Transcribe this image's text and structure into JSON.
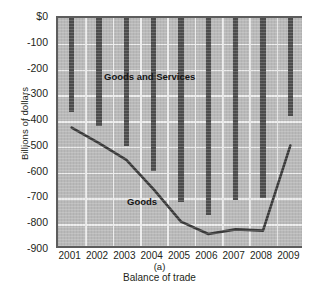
{
  "chart_data": {
    "type": "bar",
    "title": "",
    "subtitle": "",
    "panel_letter": "(a)",
    "xlabel": "Balance of trade",
    "ylabel": "Billions of dollars",
    "categories": [
      "2001",
      "2002",
      "2003",
      "2004",
      "2005",
      "2006",
      "2007",
      "2008",
      "2009"
    ],
    "ylim": [
      -900,
      0
    ],
    "y_ticks": [
      0,
      -100,
      -200,
      -300,
      -400,
      -500,
      -600,
      -700,
      -800,
      -900
    ],
    "y_tick_labels": [
      "$0",
      "-100",
      "-200",
      "-300",
      "-400",
      "-500",
      "-600",
      "-700",
      "-800",
      "-900"
    ],
    "grid": true,
    "legend_position": "inline-annotations",
    "series": [
      {
        "name": "Goods and Services",
        "kind": "bar",
        "color": "#4d4d4d",
        "values": [
          -365,
          -420,
          -495,
          -595,
          -715,
          -765,
          -705,
          -700,
          -380
        ]
      },
      {
        "name": "Goods",
        "kind": "line",
        "color": "#3a3a3a",
        "values": [
          -425,
          -485,
          -550,
          -665,
          -790,
          -838,
          -820,
          -825,
          -495
        ]
      }
    ],
    "annotations": [
      {
        "text": "Goods and Services",
        "x": 2002.6,
        "y": -215
      },
      {
        "text": "Goods",
        "x": 2003.5,
        "y": -700
      }
    ]
  },
  "colors": {
    "plot_background": "#b9b9b9",
    "gridline": "#ececec",
    "axis": "#5d5d5d",
    "bar": "#4d4d4d",
    "line": "#3a3a3a",
    "text": "#231f20",
    "page_background": "#ffffff"
  }
}
